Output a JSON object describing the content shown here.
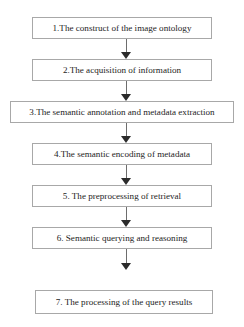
{
  "figure": {
    "type": "flowchart",
    "orientation": "vertical-top-to-bottom",
    "clipped_title_remnant": "",
    "border_color": "#a8a8a8",
    "background_color": "#ffffff",
    "text_color": "#1d1d1d",
    "arrow_color": "#2b2b2b"
  },
  "nodes": [
    {
      "id": 1,
      "label": "1.The construct of the image ontology"
    },
    {
      "id": 2,
      "label": "2.The acquisition of information"
    },
    {
      "id": 3,
      "label": "3.The semantic annotation and metadata extraction"
    },
    {
      "id": 4,
      "label": "4.The semantic encoding of metadata"
    },
    {
      "id": 5,
      "label": "5. The preprocessing of retrieval"
    },
    {
      "id": 6,
      "label": "6. Semantic querying and reasoning"
    },
    {
      "id": 7,
      "label": "7. The processing of the query results"
    }
  ],
  "connectors": [
    {
      "from": 1,
      "to": 2,
      "icon": "down-arrow-icon"
    },
    {
      "from": 2,
      "to": 3,
      "icon": "down-arrow-icon"
    },
    {
      "from": 3,
      "to": 4,
      "icon": "down-arrow-icon"
    },
    {
      "from": 4,
      "to": 5,
      "icon": "down-arrow-icon"
    },
    {
      "from": 5,
      "to": 6,
      "icon": "down-arrow-icon"
    },
    {
      "from": 6,
      "to": 7,
      "icon": "down-arrow-icon"
    }
  ]
}
